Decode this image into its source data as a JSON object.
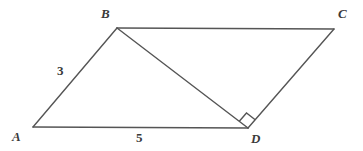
{
  "figure": {
    "type": "geometry-diagram",
    "shape": "parallelogram-with-diagonal",
    "background_color": "#ffffff",
    "stroke_color": "#555555",
    "label_color": "#3a3a3a",
    "stroke_width": 1.4,
    "vertices": [
      {
        "name": "A",
        "label": "A",
        "x": 33,
        "y": 127,
        "label_x": 12,
        "label_y": 130
      },
      {
        "name": "B",
        "label": "B",
        "x": 117,
        "y": 28,
        "label_x": 101,
        "label_y": 7
      },
      {
        "name": "C",
        "label": "C",
        "x": 334,
        "y": 29,
        "label_x": 338,
        "label_y": 7
      },
      {
        "name": "D",
        "label": "D",
        "x": 248,
        "y": 128,
        "label_x": 251,
        "label_y": 132
      }
    ],
    "edges": [
      {
        "name": "side-AB",
        "from": "A",
        "to": "B"
      },
      {
        "name": "side-BC",
        "from": "B",
        "to": "C"
      },
      {
        "name": "side-CD",
        "from": "C",
        "to": "D"
      },
      {
        "name": "side-AD",
        "from": "A",
        "to": "D"
      },
      {
        "name": "diagonal-BD",
        "from": "B",
        "to": "D"
      }
    ],
    "measures": [
      {
        "name": "length-AB",
        "value": "3",
        "edge": "side-AB",
        "x": 57,
        "y": 64
      },
      {
        "name": "length-AD",
        "value": "5",
        "edge": "side-AD",
        "x": 136,
        "y": 131
      }
    ],
    "angle_markers": [
      {
        "name": "right-angle-at-D",
        "vertex": "D",
        "type": "right-angle-square",
        "degrees": "90",
        "between": [
          "diagonal-BD",
          "side-CD"
        ],
        "size": 11
      }
    ]
  }
}
